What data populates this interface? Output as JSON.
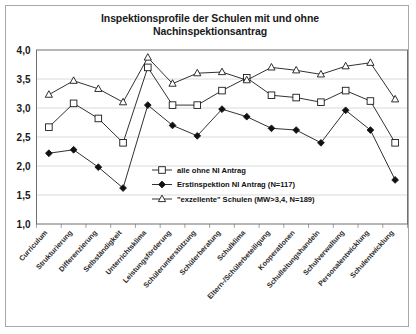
{
  "chart_data": {
    "type": "line",
    "title": "Inspektionsprofile der Schulen mit und ohne Nachinspektionsantrag",
    "title_line1": "Inspektionsprofile der Schulen mit und ohne",
    "title_line2": "Nachinspektionsantrag",
    "xlabel": "",
    "ylabel": "",
    "ylim": [
      1.0,
      4.0
    ],
    "ytick_labels": [
      "4,0",
      "3,5",
      "3,0",
      "2,5",
      "2,0",
      "1,5",
      "1,0"
    ],
    "ytick_values": [
      4.0,
      3.5,
      3.0,
      2.5,
      2.0,
      1.5,
      1.0
    ],
    "grid": true,
    "legend_position": "inside-lower-right",
    "categories": [
      "Curriculum",
      "Strukturierung",
      "Differenzierung",
      "Selbständigkeit",
      "Unterrichtsklima",
      "Leistungsförderung",
      "Schülerunterstützung",
      "Schülerberatung",
      "Schulklima",
      "Eltern-/Schülerbeteiligung",
      "Kooperationen",
      "Schulleitungshandeln",
      "Schulverwaltung",
      "Personalentwicklung",
      "Schulentwicklung"
    ],
    "series": [
      {
        "name": "alle ohne NI Antrag",
        "marker": "open-square",
        "values": [
          2.67,
          3.08,
          2.82,
          2.4,
          3.7,
          3.05,
          3.05,
          3.3,
          3.52,
          3.22,
          3.18,
          3.1,
          3.3,
          3.12,
          2.4
        ]
      },
      {
        "name": "Erstinspektion NI Antrag (N=117)",
        "marker": "filled-diamond",
        "values": [
          2.22,
          2.28,
          1.98,
          1.62,
          3.05,
          2.7,
          2.52,
          2.98,
          2.85,
          2.65,
          2.62,
          2.4,
          2.96,
          2.62,
          1.76
        ]
      },
      {
        "name": "\"exzellente\" Schulen (MW>3,4, N=189)",
        "marker": "open-triangle",
        "values": [
          3.23,
          3.47,
          3.33,
          3.1,
          3.87,
          3.42,
          3.6,
          3.62,
          3.48,
          3.7,
          3.65,
          3.58,
          3.72,
          3.78,
          3.15
        ]
      }
    ]
  }
}
